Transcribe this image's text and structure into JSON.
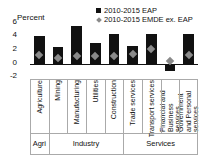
{
  "chart_data": {
    "type": "bar",
    "title": "",
    "ylabel": "Percent",
    "xlabel": "",
    "ylim": [
      -2,
      6
    ],
    "yticks": [
      6,
      4,
      2,
      0,
      -2
    ],
    "grid": false,
    "legend_position": "top-right",
    "categories": [
      "Agriculture",
      "Mining",
      "Manufacturing",
      "Utilities",
      "Construction",
      "Trade services",
      "Transport services",
      "Financial and Business services",
      "Government and Personal services"
    ],
    "groups": [
      {
        "label": "Agri",
        "start": 0,
        "end": 0
      },
      {
        "label": "Industry",
        "start": 1,
        "end": 4
      },
      {
        "label": "Services",
        "start": 5,
        "end": 8
      }
    ],
    "series": [
      {
        "name": "2010-2015 EAP",
        "marker": "square",
        "color": "#111111",
        "values": [
          4.0,
          2.5,
          5.4,
          3.0,
          4.3,
          2.6,
          4.3,
          -1.0,
          4.3
        ]
      },
      {
        "name": "2010-2015 EMDE ex. EAP",
        "marker": "diamond",
        "color": "#8a8a8a",
        "values": [
          1.3,
          0.8,
          1.2,
          1.1,
          1.1,
          1.5,
          2.1,
          0.4,
          1.3
        ]
      }
    ]
  },
  "legend": {
    "items": [
      {
        "label": "2010-2015 EAP"
      },
      {
        "label": "2010-2015 EMDE ex. EAP"
      }
    ]
  },
  "axis": {
    "y_title": "Percent",
    "tick_6": "6",
    "tick_4": "4",
    "tick_2": "2",
    "tick_0": "0",
    "tick_m2": "-2"
  }
}
